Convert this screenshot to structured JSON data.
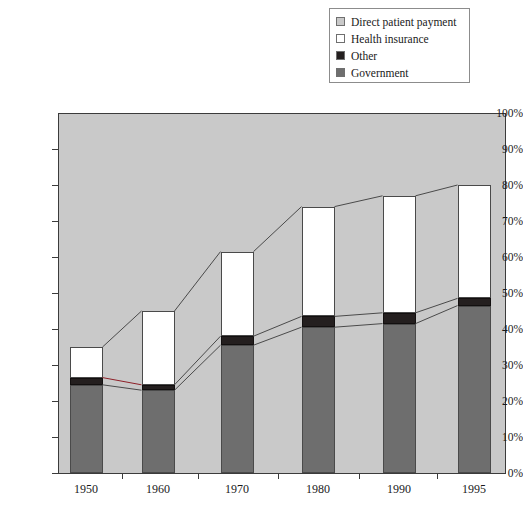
{
  "legend": {
    "items": [
      {
        "label": "Direct patient payment",
        "swatch": "legend-swatch-direct-patient-payment",
        "color": "#c9c9c9"
      },
      {
        "label": "Health insurance",
        "swatch": "legend-swatch-health-insurance",
        "color": "#ffffff"
      },
      {
        "label": "Other",
        "swatch": "legend-swatch-other",
        "color": "#241f1f"
      },
      {
        "label": "Government",
        "swatch": "legend-swatch-government",
        "color": "#6e6e6e"
      }
    ]
  },
  "axes": {
    "y_ticks": [
      "100%",
      "90%",
      "80%",
      "70%",
      "60%",
      "50%",
      "40%",
      "30%",
      "20%",
      "10%",
      "0%"
    ],
    "x_ticks": [
      "1950",
      "1960",
      "1970",
      "1980",
      "1990",
      "1995"
    ]
  },
  "chart_data": {
    "type": "bar",
    "title": "",
    "subtitle": "",
    "xlabel": "",
    "ylabel": "",
    "ylim": [
      0,
      100
    ],
    "y_tick_interval": 10,
    "grid": false,
    "stacked": true,
    "stack_order_bottom_to_top": [
      "Government",
      "Other",
      "Health insurance",
      "Direct patient payment"
    ],
    "legend_position": "top-right",
    "categories": [
      "1950",
      "1960",
      "1970",
      "1980",
      "1990",
      "1995"
    ],
    "series": [
      {
        "name": "Government",
        "color": "#6e6e6e",
        "values": [
          24.5,
          23.0,
          35.5,
          40.5,
          41.5,
          46.5
        ]
      },
      {
        "name": "Other",
        "color": "#241f1f",
        "values": [
          2.0,
          1.5,
          2.5,
          3.0,
          3.0,
          2.0
        ]
      },
      {
        "name": "Health insurance",
        "color": "#ffffff",
        "values": [
          8.5,
          20.5,
          23.5,
          30.5,
          32.5,
          31.5
        ]
      },
      {
        "name": "Direct patient payment",
        "color": "#c9c9c9",
        "values": [
          65.0,
          55.0,
          38.5,
          26.0,
          23.0,
          20.0
        ]
      }
    ],
    "cumulative_tops": {
      "Government": [
        24.5,
        23.0,
        35.5,
        40.5,
        41.5,
        46.5
      ],
      "Other": [
        26.5,
        24.5,
        38.0,
        43.5,
        44.5,
        48.5
      ],
      "Health insurance": [
        35.0,
        45.0,
        61.5,
        74.0,
        77.0,
        80.0
      ]
    }
  }
}
